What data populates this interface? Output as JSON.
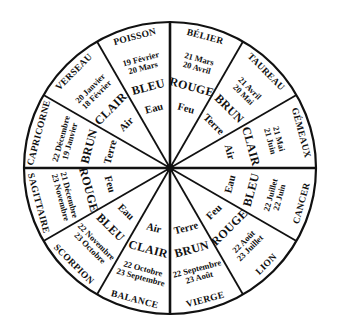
{
  "diagram": {
    "type": "zodiac-wheel",
    "center": [
      170,
      168
    ],
    "radius": 146,
    "colors": {
      "stroke": "#111111",
      "background": "#ffffff",
      "text": "#111111"
    },
    "sectors": [
      {
        "sign": "BÉLIER",
        "date_start": "21 Mars",
        "date_end": "20 Avril",
        "color": "ROUGE",
        "element": "Feu"
      },
      {
        "sign": "TAUREAU",
        "date_start": "21 Avril",
        "date_end": "20 Mai",
        "color": "BRUN",
        "element": "Terre"
      },
      {
        "sign": "GÉMEAUX",
        "date_start": "21 Mai",
        "date_end": "21 Juin",
        "color": "CLAIR",
        "element": "Air"
      },
      {
        "sign": "CANCER",
        "date_start": "22 Juin",
        "date_end": "22 Juillet",
        "color": "BLEU",
        "element": "Eau"
      },
      {
        "sign": "LION",
        "date_start": "23 Juillet",
        "date_end": "22 Août",
        "color": "ROUGE",
        "element": "Feu"
      },
      {
        "sign": "VIERGE",
        "date_start": "23 Août",
        "date_end": "22 Septembre",
        "color": "BRUN",
        "element": "Terre"
      },
      {
        "sign": "BALANCE",
        "date_start": "23 Septembre",
        "date_end": "22 Octobre",
        "color": "CLAIR",
        "element": "Air"
      },
      {
        "sign": "SCORPION",
        "date_start": "23 Octobre",
        "date_end": "22 Novembre",
        "color": "BLEU",
        "element": "Eau"
      },
      {
        "sign": "SAGITTAIRE",
        "date_start": "23 Novembre",
        "date_end": "21 Décembre",
        "color": "ROUGE",
        "element": "Feu"
      },
      {
        "sign": "CAPRICORNE",
        "date_start": "22 Décembre",
        "date_end": "19 Janvier",
        "color": "BRUN",
        "element": "Terre"
      },
      {
        "sign": "VERSEAU",
        "date_start": "20 Janvier",
        "date_end": "18 Février",
        "color": "CLAIR",
        "element": "Air"
      },
      {
        "sign": "POISSON",
        "date_start": "19 Février",
        "date_end": "20 Mars",
        "color": "BLEU",
        "element": "Eau"
      }
    ]
  }
}
